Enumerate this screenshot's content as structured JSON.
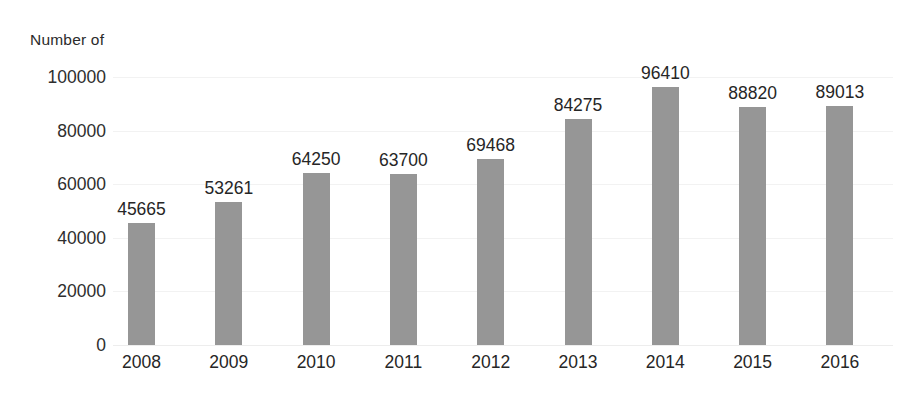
{
  "chart_data": {
    "type": "bar",
    "title": "Number of",
    "xlabel": "",
    "ylabel": "",
    "categories": [
      "2008",
      "2009",
      "2010",
      "2011",
      "2012",
      "2013",
      "2014",
      "2015",
      "2016"
    ],
    "values": [
      45665,
      53261,
      64250,
      63700,
      69468,
      84275,
      96410,
      88820,
      89013
    ],
    "data_labels": [
      "45665",
      "53261",
      "64250",
      "63700",
      "69468",
      "84275",
      "96410",
      "88820",
      "89013"
    ],
    "ylim": [
      0,
      100000
    ],
    "yticks": [
      0,
      20000,
      40000,
      60000,
      80000,
      100000
    ],
    "ytick_labels": [
      "0",
      "20000",
      "40000",
      "60000",
      "80000",
      "100000"
    ],
    "grid": true,
    "legend": "none",
    "series": [
      {
        "name": "Number of",
        "color": "#969696",
        "values": [
          45665,
          53261,
          64250,
          63700,
          69468,
          84275,
          96410,
          88820,
          89013
        ]
      }
    ]
  },
  "colors": {
    "bar": "#969696",
    "background": "#ffffff",
    "gridline": "#f2f2f2",
    "text": "#262626"
  }
}
